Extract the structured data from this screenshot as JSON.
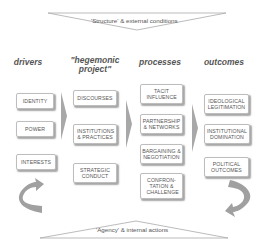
{
  "top_banner": {
    "label": "'Structure' & external conditions"
  },
  "bottom_banner": {
    "label": "'Agency' & internal actions"
  },
  "columns": [
    {
      "heading": "drivers",
      "items": [
        "IDENTITY",
        "POWER",
        "INTERESTS"
      ]
    },
    {
      "heading": "\"hegemonic project\"",
      "items": [
        "DISCOURSES",
        "INSTITUTIONS & PRACTICES",
        "STRATEGIC CONDUCT"
      ]
    },
    {
      "heading": "processes",
      "items": [
        "TACIT INFLUENCE",
        "PARTNERSHIP & NETWORKS",
        "BARGAINING & NEGOTIATION",
        "CONFRON-TATION & CHALLENGE"
      ]
    },
    {
      "heading": "outcomes",
      "items": [
        "IDEOLOGICAL LEGITIMATION",
        "INSTITUTIONAL DOMINATION",
        "POLITICAL OUTCOMES"
      ]
    }
  ],
  "colors": {
    "line": "#aaaaaa",
    "arrow_fill": "#a8a8a8",
    "box_border": "#bdbdbd",
    "text": "#555555"
  }
}
